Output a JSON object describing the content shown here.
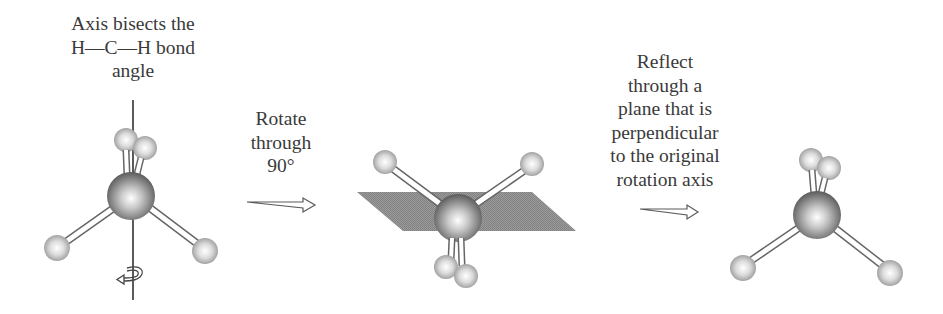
{
  "captions": {
    "axis": {
      "lines": [
        "Axis bisects the",
        "H—C—H bond",
        "angle"
      ]
    },
    "rotate": {
      "lines": [
        "Rotate",
        "through",
        "90°"
      ]
    },
    "reflect": {
      "lines": [
        "Reflect",
        "through a",
        "plane that is",
        "perpendicular",
        "to the original",
        "rotation axis"
      ]
    }
  },
  "steps": [
    {
      "id": "original",
      "description": "Tetrahedral CH4 molecule with vertical rotation axis bisecting H-C-H angle"
    },
    {
      "id": "rotated",
      "description": "Molecule rotated 90 degrees about the axis, shown with a horizontal reflection plane"
    },
    {
      "id": "reflected",
      "description": "Molecule after reflection through the plane perpendicular to the rotation axis"
    }
  ],
  "arrows": [
    {
      "id": "arrow-rotate",
      "direction": "right"
    },
    {
      "id": "arrow-reflect",
      "direction": "right"
    }
  ],
  "colors": {
    "text": "#3a3a3a",
    "carbon_light": "#ffffff",
    "carbon_dark": "#5a5a5a",
    "hydrogen_light": "#ffffff",
    "hydrogen_dark": "#9a9a9a",
    "plane": "#8c8c8c",
    "bond_outline": "#6a6a6a"
  }
}
